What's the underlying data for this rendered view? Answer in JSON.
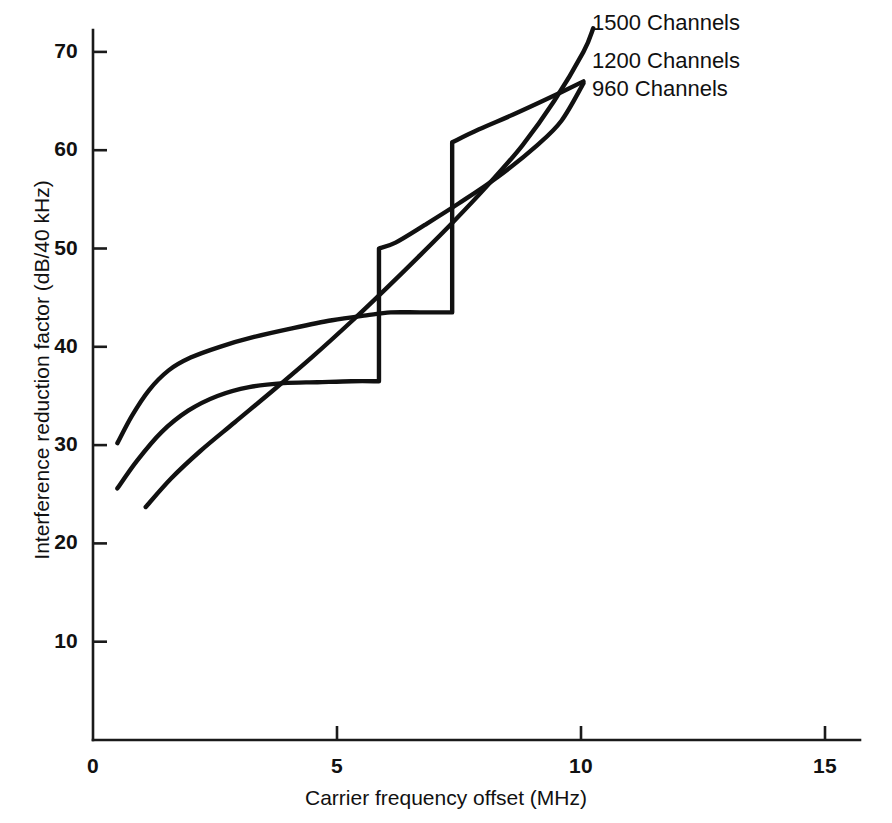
{
  "chart_data": {
    "type": "line",
    "title": "",
    "xlabel": "Carrier frequency offset (MHz)",
    "ylabel": "Interference reduction factor (dB/40 kHz)",
    "xlim": [
      0,
      15.7
    ],
    "ylim": [
      0,
      75
    ],
    "xticks": [
      "0",
      "5",
      "10",
      "15"
    ],
    "xtick_values": [
      0,
      5,
      10,
      15
    ],
    "yticks": [
      "10",
      "20",
      "30",
      "40",
      "50",
      "60",
      "70"
    ],
    "ytick_values": [
      10,
      20,
      30,
      40,
      50,
      60,
      70
    ],
    "grid": false,
    "legend_position": "inline-right-labels",
    "line_color": "#111111",
    "background_color": "#ffffff",
    "series": [
      {
        "name": "960 Channels",
        "label": "960 Channels",
        "label_x": 10.2,
        "label_y": 68.5,
        "points": [
          [
            0.5,
            30.2
          ],
          [
            0.8,
            33.0
          ],
          [
            1.15,
            35.6
          ],
          [
            1.55,
            37.6
          ],
          [
            2.0,
            38.9
          ],
          [
            2.6,
            40.0
          ],
          [
            3.3,
            41.0
          ],
          [
            4.1,
            41.9
          ],
          [
            4.9,
            42.7
          ],
          [
            5.6,
            43.2
          ],
          [
            6.1,
            43.5
          ],
          [
            6.7,
            43.5
          ],
          [
            7.36,
            43.5
          ],
          [
            7.36,
            60.8
          ],
          [
            7.9,
            62.1
          ],
          [
            8.6,
            63.6
          ],
          [
            9.3,
            65.2
          ],
          [
            10.05,
            67.0
          ]
        ],
        "step_offset_mhz": 7.36,
        "step_from_db": 43.5,
        "step_to_db": 60.8
      },
      {
        "name": "1200 Channels",
        "label": "1200 Channels",
        "label_x": 10.2,
        "label_y": 72.0,
        "points": [
          [
            0.5,
            25.6
          ],
          [
            0.9,
            28.4
          ],
          [
            1.4,
            31.3
          ],
          [
            1.95,
            33.5
          ],
          [
            2.55,
            35.0
          ],
          [
            3.2,
            35.9
          ],
          [
            3.9,
            36.3
          ],
          [
            4.6,
            36.4
          ],
          [
            5.3,
            36.5
          ],
          [
            5.86,
            36.5
          ],
          [
            5.86,
            50.0
          ],
          [
            6.2,
            50.6
          ],
          [
            6.8,
            52.4
          ],
          [
            7.5,
            54.6
          ],
          [
            8.3,
            57.3
          ],
          [
            9.1,
            60.5
          ],
          [
            9.6,
            63.0
          ],
          [
            10.05,
            66.8
          ]
        ],
        "step_offset_mhz": 5.86,
        "step_from_db": 36.5,
        "step_to_db": 50.0
      },
      {
        "name": "1500 Channels",
        "label": "1500 Channels",
        "label_x": 10.2,
        "label_y": 75.0,
        "points": [
          [
            1.08,
            23.7
          ],
          [
            1.6,
            26.6
          ],
          [
            2.2,
            29.4
          ],
          [
            2.9,
            32.3
          ],
          [
            3.7,
            35.6
          ],
          [
            4.5,
            39.0
          ],
          [
            5.3,
            42.6
          ],
          [
            6.0,
            45.9
          ],
          [
            6.7,
            49.3
          ],
          [
            7.4,
            52.8
          ],
          [
            8.1,
            56.5
          ],
          [
            8.8,
            60.5
          ],
          [
            9.45,
            65.0
          ],
          [
            10.05,
            70.0
          ],
          [
            10.25,
            72.4
          ]
        ],
        "step_offset_mhz": null,
        "step_from_db": null,
        "step_to_db": null
      }
    ]
  },
  "axes": {
    "x_title": "Carrier frequency offset (MHz)",
    "y_title": "Interference reduction factor (dB/40 kHz)"
  },
  "annotations": {
    "series_1500": "1500 Channels",
    "series_1200": "1200 Channels",
    "series_960": "960 Channels"
  }
}
